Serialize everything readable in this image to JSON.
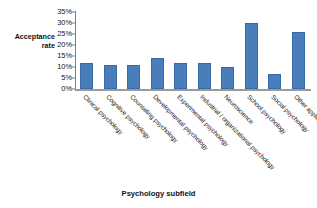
{
  "chart_data": {
    "type": "bar",
    "title": "",
    "xlabel": "Psychology subfield",
    "ylabel": "Acceptance\nrate",
    "ylim": [
      0,
      35
    ],
    "ytick_labels": [
      "35%",
      "30%",
      "25%",
      "20%",
      "15%",
      "10%",
      "5%",
      "0%"
    ],
    "ytick_values": [
      35,
      30,
      25,
      20,
      15,
      10,
      5,
      0
    ],
    "grid": false,
    "legend": null,
    "bar_color": "#4a7ebb",
    "axis_color": "#808080",
    "categories": [
      "Clinical psychology",
      "Cognitive psychology",
      "Counseling psychology",
      "Developmental psychology",
      "Experimental psychology",
      "Industrial / organizational psychology",
      "Neuroscience",
      "School psychology",
      "Social psychology",
      "Other applied psychology"
    ],
    "values": [
      12,
      11,
      11,
      14,
      12,
      12,
      10,
      30,
      7,
      26
    ],
    "value_labels": [
      "12%",
      "11%",
      "11%",
      "14%",
      "12%",
      "12%",
      "10%",
      "30%",
      "7%",
      "26%"
    ]
  }
}
